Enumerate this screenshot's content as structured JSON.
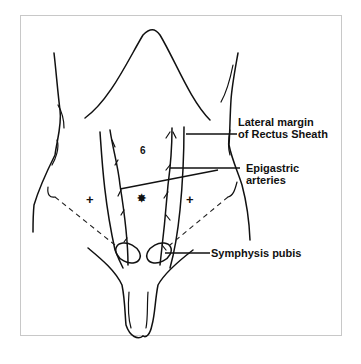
{
  "diagram": {
    "labels": {
      "rectus_sheath_line1": "Lateral margin",
      "rectus_sheath_line2": "of Rectus Sheath",
      "epigastric_line1": "Epigastric",
      "epigastric_line2": "arteries",
      "symphysis": "Symphysis pubis"
    },
    "markers": {
      "umbilicus": "6",
      "midline_port": "✸",
      "left_port": "+",
      "right_port": "+"
    },
    "colors": {
      "ink": "#111111",
      "frame_border": "#c8c8c8",
      "background": "#ffffff"
    }
  }
}
